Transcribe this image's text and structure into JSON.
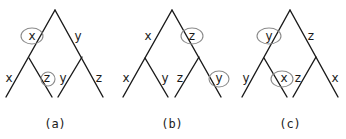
{
  "diagram": {
    "type": "binary-tree-rotations",
    "trees": [
      {
        "id": "a",
        "caption": "(a)",
        "apex": [
          55,
          10
        ],
        "internal": [
          [
            29,
            58
          ],
          [
            82,
            57
          ]
        ],
        "leaves": [
          [
            6,
            97
          ],
          [
            52,
            97
          ],
          [
            58,
            97
          ],
          [
            103,
            97
          ]
        ],
        "labels": [
          {
            "text": "x",
            "pos": [
              32,
              40
            ],
            "circled": true,
            "circle": [
              32,
              36,
              11,
              8
            ]
          },
          {
            "text": "y",
            "pos": [
              78,
              40
            ],
            "circled": false
          },
          {
            "text": "x",
            "pos": [
              9,
              82
            ],
            "circled": false
          },
          {
            "text": "z",
            "pos": [
              47,
              82
            ],
            "circled": true,
            "circle": [
              48,
              79,
              7,
              7
            ]
          },
          {
            "text": "y",
            "pos": [
              63,
              82
            ],
            "circled": false
          },
          {
            "text": "z",
            "pos": [
              99,
              82
            ],
            "circled": false
          }
        ]
      },
      {
        "id": "b",
        "caption": "(b)",
        "apex": [
          172,
          10
        ],
        "internal": [
          [
            145,
            58
          ],
          [
            199,
            57
          ]
        ],
        "leaves": [
          [
            123,
            97
          ],
          [
            168,
            97
          ],
          [
            175,
            97
          ],
          [
            221,
            97
          ]
        ],
        "labels": [
          {
            "text": "x",
            "pos": [
              148,
              40
            ],
            "circled": false
          },
          {
            "text": "z",
            "pos": [
              192,
              40
            ],
            "circled": true,
            "circle": [
              192,
              36,
              11,
              8
            ]
          },
          {
            "text": "x",
            "pos": [
              126,
              82
            ],
            "circled": false
          },
          {
            "text": "y",
            "pos": [
              165,
              82
            ],
            "circled": false
          },
          {
            "text": "z",
            "pos": [
              180,
              82
            ],
            "circled": false
          },
          {
            "text": "y",
            "pos": [
              219,
              82
            ],
            "circled": true,
            "circle": [
              219,
              79,
              10,
              8
            ]
          }
        ]
      },
      {
        "id": "c",
        "caption": "(c)",
        "apex": [
          290,
          10
        ],
        "internal": [
          [
            264,
            58
          ],
          [
            316,
            57
          ]
        ],
        "leaves": [
          [
            242,
            97
          ],
          [
            287,
            97
          ],
          [
            293,
            97
          ],
          [
            338,
            97
          ]
        ],
        "labels": [
          {
            "text": "y",
            "pos": [
              269,
              40
            ],
            "circled": true,
            "circle": [
              269,
              36,
              12,
              8
            ]
          },
          {
            "text": "z",
            "pos": [
              311,
              40
            ],
            "circled": false
          },
          {
            "text": "y",
            "pos": [
              246,
              82
            ],
            "circled": false
          },
          {
            "text": "x",
            "pos": [
              284,
              82
            ],
            "circled": true,
            "circle": [
              282,
              79,
              11,
              8
            ]
          },
          {
            "text": "z",
            "pos": [
              298,
              82
            ],
            "circled": false
          },
          {
            "text": "x",
            "pos": [
              335,
              82
            ],
            "circled": false
          }
        ]
      }
    ],
    "caption_y": 128
  }
}
